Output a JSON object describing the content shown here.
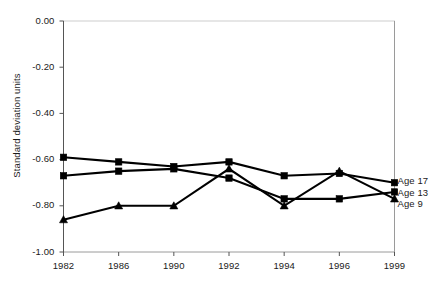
{
  "chart_data": {
    "type": "line",
    "title": "",
    "subtitle": "",
    "xlabel": "",
    "ylabel": "Standard deviation units",
    "categories": [
      "1982",
      "1986",
      "1990",
      "1992",
      "1994",
      "1996",
      "1999"
    ],
    "x_tick_labels": [
      "1982",
      "1986",
      "1990",
      "1992",
      "1994",
      "1996",
      "1999"
    ],
    "y_tick_labels": [
      "0.00",
      "-0.20",
      "-0.40",
      "-0.60",
      "-0.80",
      "-1.00"
    ],
    "y_tick_values": [
      0.0,
      -0.2,
      -0.4,
      -0.6,
      -0.8,
      -1.0
    ],
    "ylim": [
      -1.0,
      0.0
    ],
    "grid": false,
    "legend_position": "right-inline",
    "series": [
      {
        "name": "Age 17",
        "label": "Age 17",
        "marker": "square",
        "color": "#000000",
        "values": [
          -0.59,
          -0.61,
          -0.63,
          -0.61,
          -0.67,
          -0.66,
          -0.7
        ]
      },
      {
        "name": "Age 13",
        "label": "Age 13",
        "marker": "square",
        "color": "#000000",
        "values": [
          -0.67,
          -0.65,
          -0.64,
          -0.68,
          -0.77,
          -0.77,
          -0.74
        ]
      },
      {
        "name": "Age 9",
        "label": "Age 9",
        "marker": "triangle",
        "color": "#000000",
        "values": [
          -0.86,
          -0.8,
          -0.8,
          -0.64,
          -0.8,
          -0.65,
          -0.77
        ]
      }
    ],
    "axis_color": "#555555",
    "frame_color": "#9a9a9a",
    "line_color": "#000000"
  }
}
